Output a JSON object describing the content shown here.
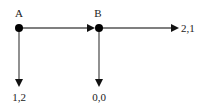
{
  "diagram": {
    "type": "game-tree",
    "nodes": [
      {
        "id": "A",
        "label": "A"
      },
      {
        "id": "B",
        "label": "B"
      }
    ],
    "edges": [
      {
        "from": "A",
        "to": "B",
        "direction": "right"
      },
      {
        "from": "A",
        "to": "payoff_A",
        "direction": "down"
      },
      {
        "from": "B",
        "to": "payoff_B_down",
        "direction": "down"
      },
      {
        "from": "B",
        "to": "payoff_B_right",
        "direction": "right"
      }
    ],
    "payoffs": {
      "payoff_A": "1,2",
      "payoff_B_down": "0,0",
      "payoff_B_right": "2,1"
    }
  }
}
